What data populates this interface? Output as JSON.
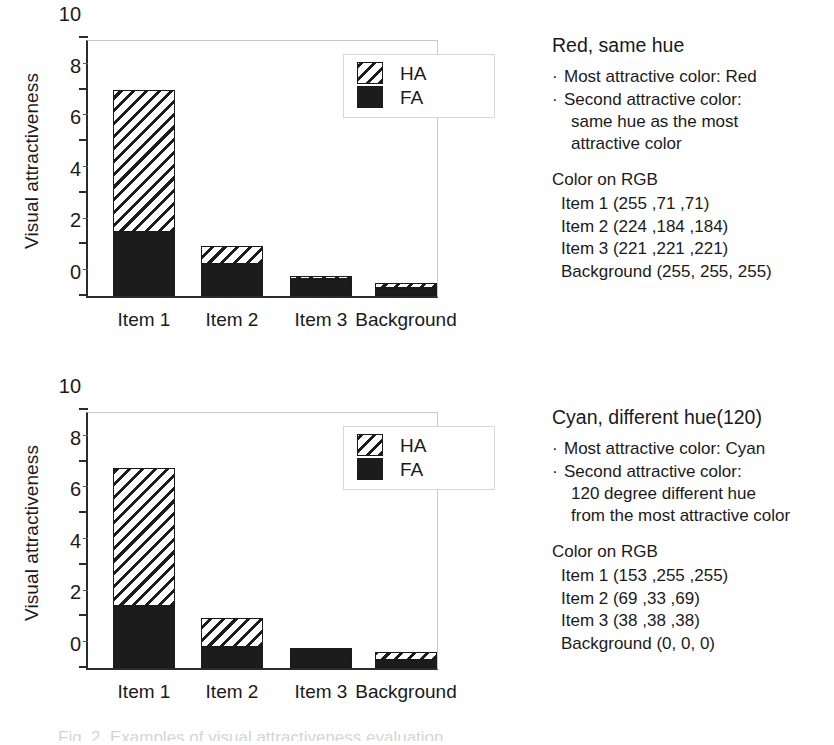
{
  "figure": {
    "caption": "Fig. 2. Examples of visual attractiveness evaluation"
  },
  "legend": {
    "items": [
      {
        "label": "HA",
        "pattern": "hatched"
      },
      {
        "label": "FA",
        "pattern": "solid-black"
      }
    ]
  },
  "axis": {
    "ylabel": "Visual attractiveness",
    "yticks": [
      "0",
      "2",
      "4",
      "6",
      "8",
      "10"
    ],
    "ytick_values": [
      0,
      2,
      4,
      6,
      8,
      10
    ],
    "yminor_values": [
      1,
      3,
      5,
      7,
      9
    ],
    "ymin": 0,
    "ymax": 10,
    "categories": [
      "Item 1",
      "Item 2",
      "Item 3",
      "Background"
    ]
  },
  "panels": [
    {
      "id": "red-same-hue",
      "title": "Red, same hue",
      "bullets": [
        {
          "dot": "·",
          "lines": [
            "Most attractive color: Red"
          ]
        },
        {
          "dot": "·",
          "lines": [
            "Second attractive color:",
            "same hue as the most",
            "attractive color"
          ]
        }
      ],
      "rgb_heading": "Color on RGB",
      "rgb_rows": [
        "Item 1 (255 ,71 ,71)",
        "Item 2 (224 ,184 ,184)",
        "Item 3 (221 ,221 ,221)",
        "Background (255, 255, 255)"
      ]
    },
    {
      "id": "cyan-different-hue",
      "title": "Cyan, different hue(120)",
      "bullets": [
        {
          "dot": "·",
          "lines": [
            "Most attractive color: Cyan"
          ]
        },
        {
          "dot": "·",
          "lines": [
            "Second attractive color:",
            "120 degree different hue",
            "from the most attractive color"
          ]
        }
      ],
      "rgb_heading": "Color on RGB",
      "rgb_rows": [
        "Item 1 (153 ,255 ,255)",
        "Item 2 (69 ,33 ,69)",
        "Item 3 (38 ,38 ,38)",
        "Background (0, 0, 0)"
      ]
    }
  ],
  "chart_data": [
    {
      "type": "bar",
      "stacked": true,
      "title": "Red, same hue",
      "xlabel": "",
      "ylabel": "Visual attractiveness",
      "ylim": [
        0,
        10
      ],
      "grid": false,
      "legend_position": "top-right",
      "categories": [
        "Item 1",
        "Item 2",
        "Item 3",
        "Background"
      ],
      "series": [
        {
          "name": "FA",
          "values": [
            2.5,
            1.25,
            0.65,
            0.3
          ]
        },
        {
          "name": "HA",
          "values": [
            5.5,
            0.7,
            0.13,
            0.2
          ]
        }
      ],
      "totals": [
        8.0,
        1.95,
        0.78,
        0.5
      ]
    },
    {
      "type": "bar",
      "stacked": true,
      "title": "Cyan, different hue(120)",
      "xlabel": "",
      "ylabel": "Visual attractiveness",
      "ylim": [
        0,
        10
      ],
      "grid": false,
      "legend_position": "top-right",
      "categories": [
        "Item 1",
        "Item 2",
        "Item 3",
        "Background"
      ],
      "series": [
        {
          "name": "FA",
          "values": [
            2.4,
            0.8,
            0.78,
            0.3
          ]
        },
        {
          "name": "HA",
          "values": [
            5.35,
            1.15,
            0.0,
            0.32
          ]
        }
      ],
      "totals": [
        7.75,
        1.95,
        0.78,
        0.62
      ]
    }
  ]
}
